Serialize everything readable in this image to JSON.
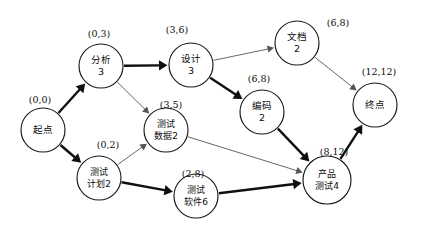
{
  "diagram": {
    "type": "pert-activity-network",
    "title": "",
    "canvas": {
      "width": 428,
      "height": 238,
      "background": "#ffffff"
    },
    "colors": {
      "node_stroke": "#1a1a1a",
      "node_fill": "#ffffff",
      "critical_edge": "#101010",
      "normal_edge": "#555555",
      "text": "#0d0d0d"
    },
    "time_label_format": "(ES,EF)",
    "nodes": [
      {
        "id": "start",
        "line1": "起点",
        "line2": "",
        "time": "(0,0)",
        "cx": 43,
        "cy": 130,
        "r": 22,
        "time_x": 40,
        "time_y": 100
      },
      {
        "id": "analysis",
        "line1": "分析",
        "line2": "3",
        "time": "(0,3)",
        "cx": 101,
        "cy": 66,
        "r": 22,
        "time_x": 99,
        "time_y": 34
      },
      {
        "id": "design",
        "line1": "设计",
        "line2": "3",
        "time": "(3,6)",
        "cx": 191,
        "cy": 65,
        "r": 22,
        "time_x": 177,
        "time_y": 30
      },
      {
        "id": "document",
        "line1": "文档",
        "line2": "2",
        "time": "(6,8)",
        "cx": 297,
        "cy": 43,
        "r": 22,
        "time_x": 338,
        "time_y": 23
      },
      {
        "id": "coding",
        "line1": "编码",
        "line2": "2",
        "time": "(6,8)",
        "cx": 262,
        "cy": 112,
        "r": 22,
        "time_x": 259,
        "time_y": 79
      },
      {
        "id": "end",
        "line1": "终点",
        "line2": "",
        "time": "(12,12)",
        "cx": 375,
        "cy": 105,
        "r": 22,
        "time_x": 379,
        "time_y": 72
      },
      {
        "id": "test-data",
        "line1": "测试",
        "line2": "数据2",
        "time": "(3,5)",
        "cx": 166,
        "cy": 130,
        "r": 22,
        "time_x": 171,
        "time_y": 105
      },
      {
        "id": "test-plan",
        "line1": "测试",
        "line2": "计划2",
        "time": "(0,2)",
        "cx": 99,
        "cy": 178,
        "r": 22,
        "time_x": 108,
        "time_y": 145
      },
      {
        "id": "test-software",
        "line1": "测试",
        "line2": "软件6",
        "time": "(2,8)",
        "cx": 196,
        "cy": 196,
        "r": 22,
        "time_x": 193,
        "time_y": 174
      },
      {
        "id": "product-test",
        "line1": "产品",
        "line2": "测试4",
        "time": "(8,12)",
        "cx": 327,
        "cy": 180,
        "r": 24,
        "time_x": 334,
        "time_y": 152
      }
    ],
    "edges": [
      {
        "from": "start",
        "to": "analysis",
        "critical": true
      },
      {
        "from": "start",
        "to": "test-plan",
        "critical": true
      },
      {
        "from": "analysis",
        "to": "design",
        "critical": true
      },
      {
        "from": "analysis",
        "to": "test-data",
        "critical": false
      },
      {
        "from": "design",
        "to": "document",
        "critical": false
      },
      {
        "from": "design",
        "to": "coding",
        "critical": true
      },
      {
        "from": "document",
        "to": "end",
        "critical": false
      },
      {
        "from": "coding",
        "to": "product-test",
        "critical": true
      },
      {
        "from": "test-plan",
        "to": "test-data",
        "critical": false
      },
      {
        "from": "test-plan",
        "to": "test-software",
        "critical": true
      },
      {
        "from": "test-data",
        "to": "product-test",
        "critical": false
      },
      {
        "from": "test-software",
        "to": "product-test",
        "critical": true
      },
      {
        "from": "product-test",
        "to": "end",
        "critical": true
      }
    ]
  }
}
